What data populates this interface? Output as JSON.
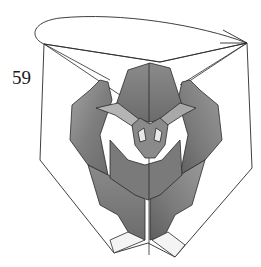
{
  "step": {
    "number": "59"
  },
  "diagram": {
    "instruction_symbol": "fold-behind arrow (loop arrow over top)",
    "colors": {
      "background": "#ffffff",
      "line": "#2a2a2a",
      "paper_dark": "#6e6e6e",
      "paper_mid": "#8c8c8c",
      "paper_light": "#b0b0b0",
      "paper_white": "#f4f4f4"
    }
  }
}
